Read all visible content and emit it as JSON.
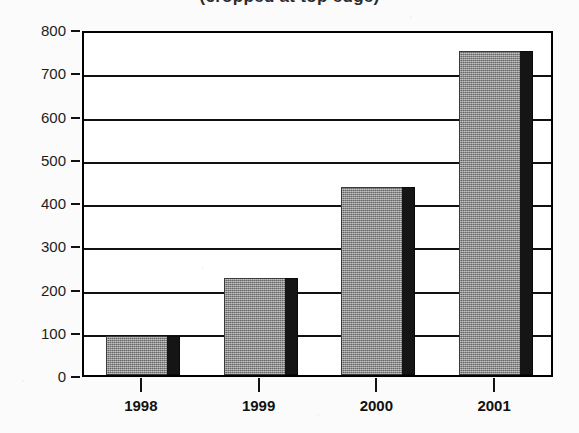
{
  "chart_data": {
    "type": "bar",
    "title": "(cropped at top edge)",
    "xlabel": "",
    "ylabel": "",
    "categories": [
      "1998",
      "1999",
      "2000",
      "2001"
    ],
    "values": [
      90,
      225,
      435,
      750
    ],
    "ylim": [
      0,
      800
    ],
    "ytick_labels": [
      "0",
      "100",
      "200",
      "300",
      "400",
      "500",
      "600",
      "700",
      "800"
    ],
    "ytick_values": [
      0,
      100,
      200,
      300,
      400,
      500,
      600,
      700,
      800
    ],
    "grid": "horizontal",
    "legend": "none",
    "series": [
      {
        "name": "Series 1",
        "values": [
          90,
          225,
          435,
          750
        ]
      }
    ],
    "colors": {
      "bar_face": "#8d8d8d",
      "bar_shadow": "#151515",
      "axis": "#111111",
      "background": "#fbfbfb",
      "plot_background": "#ffffff"
    }
  }
}
